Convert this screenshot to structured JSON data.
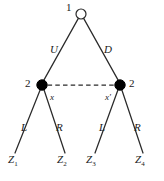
{
  "figure": {
    "type": "extensive-form-game-tree",
    "background_color": "#ffffff",
    "line_color": "#2a2a2a",
    "node_fill_color": "#000000",
    "node_open_fill_color": "#ffffff"
  },
  "nodes": [
    {
      "id": "root",
      "player_label": "1",
      "style": "open-circle",
      "x": 81,
      "y": 14,
      "r": 5.2,
      "label_dx": -13,
      "label_dy": -11
    },
    {
      "id": "left-node",
      "player_label": "2",
      "style": "filled-circle",
      "x": 42,
      "y": 85,
      "r": 5.2,
      "label_dx": -18,
      "label_dy": -7
    },
    {
      "id": "right-node",
      "player_label": "2",
      "style": "filled-circle",
      "x": 120,
      "y": 85,
      "r": 5.2,
      "label_dx": 9,
      "label_dy": -7
    }
  ],
  "edges": [
    {
      "id": "edge-U",
      "from": "root",
      "to": "left-node",
      "action_label": "U"
    },
    {
      "id": "edge-D",
      "from": "root",
      "to": "right-node",
      "action_label": "D"
    },
    {
      "id": "edge-L1",
      "from": "left-node",
      "to": "leaf-z1",
      "action_label": "L"
    },
    {
      "id": "edge-R1",
      "from": "left-node",
      "to": "leaf-z2",
      "action_label": "R"
    },
    {
      "id": "edge-L2",
      "from": "right-node",
      "to": "leaf-z3",
      "action_label": "L"
    },
    {
      "id": "edge-R2",
      "from": "right-node",
      "to": "leaf-z4",
      "action_label": "R"
    }
  ],
  "information_set": {
    "id": "info-set-player2",
    "style": "dashed",
    "connects": [
      "left-node",
      "right-node"
    ],
    "label": ""
  },
  "action_labels": {
    "u": "U",
    "d": "D",
    "l1": "L",
    "r1": "R",
    "l2": "L",
    "r2": "R"
  },
  "node_labels": {
    "root_player": "1",
    "left_player": "2",
    "right_player": "2",
    "x": "x",
    "x_prime": "x′"
  },
  "leaves": [
    {
      "id": "leaf-z1",
      "base": "Z",
      "sub": "1",
      "x": 15,
      "y": 160
    },
    {
      "id": "leaf-z2",
      "base": "Z",
      "sub": "2",
      "x": 64,
      "y": 160
    },
    {
      "id": "leaf-z3",
      "base": "Z",
      "sub": "3",
      "x": 93,
      "y": 160
    },
    {
      "id": "leaf-z4",
      "base": "Z",
      "sub": "4",
      "x": 142,
      "y": 160
    }
  ]
}
